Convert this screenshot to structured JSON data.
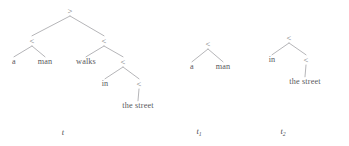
{
  "figure": {
    "kind": "ccg-derivation-trees",
    "width": 349,
    "height": 146,
    "background": "#ffffff",
    "ink_color": "#58585c",
    "edge_color": "#87878b"
  },
  "trees": [
    {
      "id": "t",
      "label": "t",
      "label_sub": "",
      "label_pos": {
        "x": 63,
        "y": 133
      },
      "nodes": [
        {
          "id": "t-root",
          "text": ">",
          "kind": "op",
          "x": 70,
          "y": 11
        },
        {
          "id": "t-left",
          "text": "<",
          "kind": "op",
          "x": 32,
          "y": 41
        },
        {
          "id": "t-right",
          "text": "<",
          "kind": "op",
          "x": 104,
          "y": 41
        },
        {
          "id": "t-a",
          "text": "a",
          "kind": "leaf",
          "x": 14,
          "y": 62
        },
        {
          "id": "t-man",
          "text": "man",
          "kind": "leaf",
          "x": 45,
          "y": 62
        },
        {
          "id": "t-walks",
          "text": "walks",
          "kind": "leaf",
          "x": 86,
          "y": 62
        },
        {
          "id": "t-in-op",
          "text": "<",
          "kind": "op",
          "x": 123,
          "y": 62
        },
        {
          "id": "t-in",
          "text": "in",
          "kind": "leaf",
          "x": 105,
          "y": 84
        },
        {
          "id": "t-street-op",
          "text": "<",
          "kind": "op",
          "x": 139,
          "y": 84
        },
        {
          "id": "t-street",
          "text": "the street",
          "kind": "leaf",
          "x": 138,
          "y": 106
        }
      ],
      "edges": [
        {
          "from": "t-root",
          "to": "t-left"
        },
        {
          "from": "t-root",
          "to": "t-right"
        },
        {
          "from": "t-left",
          "to": "t-a"
        },
        {
          "from": "t-left",
          "to": "t-man"
        },
        {
          "from": "t-right",
          "to": "t-walks"
        },
        {
          "from": "t-right",
          "to": "t-in-op"
        },
        {
          "from": "t-in-op",
          "to": "t-in"
        },
        {
          "from": "t-in-op",
          "to": "t-street-op"
        },
        {
          "from": "t-street-op",
          "to": "t-street"
        }
      ]
    },
    {
      "id": "t1",
      "label": "t",
      "label_sub": "1",
      "label_pos": {
        "x": 199,
        "y": 133
      },
      "nodes": [
        {
          "id": "t1-root",
          "text": "<",
          "kind": "op",
          "x": 208,
          "y": 44
        },
        {
          "id": "t1-a",
          "text": "a",
          "kind": "leaf",
          "x": 192,
          "y": 67
        },
        {
          "id": "t1-man",
          "text": "man",
          "kind": "leaf",
          "x": 223,
          "y": 67
        }
      ],
      "edges": [
        {
          "from": "t1-root",
          "to": "t1-a"
        },
        {
          "from": "t1-root",
          "to": "t1-man"
        }
      ]
    },
    {
      "id": "t2",
      "label": "t",
      "label_sub": "2",
      "label_pos": {
        "x": 283,
        "y": 133
      },
      "nodes": [
        {
          "id": "t2-root",
          "text": "<",
          "kind": "op",
          "x": 289,
          "y": 38
        },
        {
          "id": "t2-in",
          "text": "in",
          "kind": "leaf",
          "x": 272,
          "y": 60
        },
        {
          "id": "t2-inner-op",
          "text": "<",
          "kind": "op",
          "x": 306,
          "y": 60
        },
        {
          "id": "t2-street",
          "text": "the street",
          "kind": "leaf",
          "x": 305,
          "y": 82
        }
      ],
      "edges": [
        {
          "from": "t2-root",
          "to": "t2-in"
        },
        {
          "from": "t2-root",
          "to": "t2-inner-op"
        },
        {
          "from": "t2-inner-op",
          "to": "t2-street"
        }
      ]
    }
  ]
}
